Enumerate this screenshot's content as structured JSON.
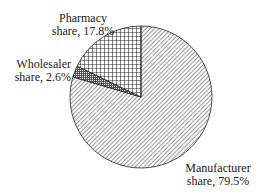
{
  "chart_data": {
    "type": "pie",
    "title": "",
    "categories": [
      "Manufacturer share",
      "Wholesaler share",
      "Pharmacy share"
    ],
    "values": [
      79.5,
      2.6,
      17.8
    ],
    "patterns": [
      "diagonal-hatch",
      "dense-crosshatch",
      "grid-crosshatch"
    ],
    "start_angle": "12 o'clock",
    "direction": "clockwise",
    "legend": "none (inline labels)"
  },
  "labels": {
    "pharmacy": {
      "line1": "Pharmacy",
      "line2": "share, 17.8%"
    },
    "wholesaler": {
      "line1": "Wholesaler",
      "line2": "share, 2.6%"
    },
    "manufacturer": {
      "line1": "Manufacturer",
      "line2": "share, 79.5%"
    }
  }
}
